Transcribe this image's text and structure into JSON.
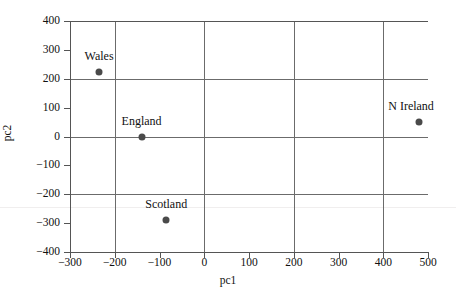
{
  "chart_data": {
    "type": "scatter",
    "title": "",
    "xlabel": "pc1",
    "ylabel": "pc2",
    "xlim": [
      -300,
      500
    ],
    "ylim": [
      -400,
      400
    ],
    "xticks": [
      -300,
      -200,
      -100,
      0,
      100,
      200,
      300,
      400,
      500
    ],
    "yticks": [
      -400,
      -300,
      -200,
      -100,
      0,
      100,
      200,
      300,
      400
    ],
    "xtick_labels": [
      "−300",
      "−200",
      "−100",
      "0",
      "100",
      "200",
      "300",
      "400",
      "500"
    ],
    "ytick_labels": [
      "−400",
      "−300",
      "−200",
      "−100",
      "0",
      "100",
      "200",
      "300",
      "400"
    ],
    "grid": true,
    "grid_x": [
      -200,
      0,
      200,
      400
    ],
    "grid_y": [
      -400,
      -200,
      0,
      200,
      400
    ],
    "legend": "none",
    "marker_color": "#4a4a4a",
    "axis_color": "#555555",
    "grid_color": "#6b6b6b",
    "background": "#ffffff",
    "points": [
      {
        "label": "Wales",
        "x": -235,
        "y": 222,
        "label_dx": 0,
        "label_dy": -10
      },
      {
        "label": "England",
        "x": -140,
        "y": 0,
        "label_dx": 0,
        "label_dy": -10
      },
      {
        "label": "Scotland",
        "x": -85,
        "y": -288,
        "label_dx": 0,
        "label_dy": -10
      },
      {
        "label": "N Ireland",
        "x": 480,
        "y": 50,
        "label_dx": -8,
        "label_dy": -10
      }
    ]
  }
}
